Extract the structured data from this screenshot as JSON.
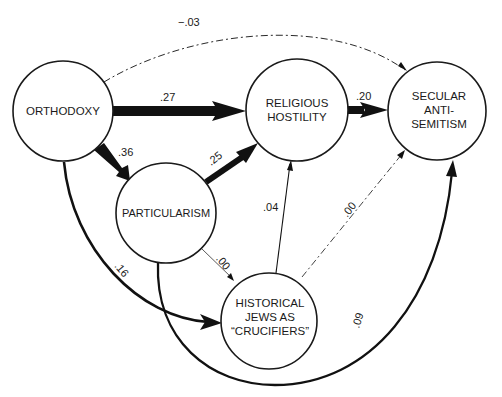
{
  "diagram": {
    "type": "path-diagram",
    "nodes": [
      {
        "id": "orthodoxy",
        "lines": [
          "ORTHODOXY"
        ]
      },
      {
        "id": "religious_hostility",
        "lines": [
          "RELIGIOUS",
          "HOSTILITY"
        ]
      },
      {
        "id": "secular_antisemitism",
        "lines": [
          "SECULAR",
          "ANTI-",
          "SEMITISM"
        ]
      },
      {
        "id": "particularism",
        "lines": [
          "PARTICULARISM"
        ]
      },
      {
        "id": "historical_jews",
        "lines": [
          "HISTORICAL",
          "JEWS AS",
          "“CRUCIFIERS”"
        ]
      }
    ],
    "edges": [
      {
        "from": "orthodoxy",
        "to": "religious_hostility",
        "coef": ".27",
        "style": "thick"
      },
      {
        "from": "orthodoxy",
        "to": "particularism",
        "coef": ".36",
        "style": "thick"
      },
      {
        "from": "orthodoxy",
        "to": "historical_jews",
        "coef": ".16",
        "style": "medium-curved"
      },
      {
        "from": "orthodoxy",
        "to": "secular_antisemitism",
        "coef": "−.03",
        "style": "dashed-curved"
      },
      {
        "from": "particularism",
        "to": "religious_hostility",
        "coef": ".25",
        "style": "thick"
      },
      {
        "from": "particularism",
        "to": "historical_jews",
        "coef": ".00",
        "style": "thin"
      },
      {
        "from": "particularism",
        "to": "secular_antisemitism",
        "coef": ".09",
        "style": "medium-curved"
      },
      {
        "from": "religious_hostility",
        "to": "secular_antisemitism",
        "coef": ".20",
        "style": "thick"
      },
      {
        "from": "historical_jews",
        "to": "religious_hostility",
        "coef": ".04",
        "style": "thin"
      },
      {
        "from": "historical_jews",
        "to": "secular_antisemitism",
        "coef": ".00",
        "style": "dashed"
      }
    ]
  }
}
